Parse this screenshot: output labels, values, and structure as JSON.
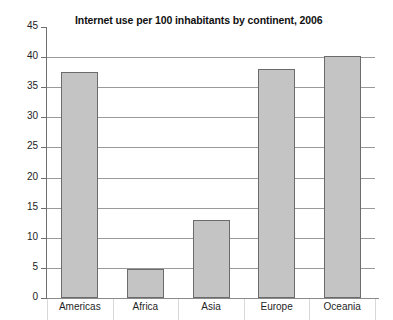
{
  "chart_data": {
    "type": "bar",
    "title": "Internet use per 100 inhabitants by continent, 2006",
    "xlabel": "",
    "ylabel": "",
    "categories": [
      "Americas",
      "Africa",
      "Asia",
      "Europe",
      "Oceania"
    ],
    "values": [
      37.5,
      4.8,
      13,
      38,
      40.2
    ],
    "ylim": [
      0,
      45
    ],
    "ytick_step": 5,
    "yticks": [
      0,
      5,
      10,
      15,
      20,
      25,
      30,
      35,
      40,
      45
    ],
    "ytick_labels": [
      "0",
      "5",
      "10",
      "15",
      "20",
      "25",
      "30",
      "35",
      "40",
      "45"
    ],
    "grid": true,
    "legend": false,
    "legend_position": "none",
    "series": [
      {
        "name": "Internet use per 100 inhabitants",
        "values": [
          37.5,
          4.8,
          13,
          38,
          40.2
        ]
      }
    ],
    "colors": {
      "bar_fill": "#c4c4c4",
      "bar_border": "#6b6b6b",
      "gridline": "#9a9a9a",
      "axis": "#6f6f6f",
      "text": "#1a1a1a",
      "background": "#ffffff"
    }
  }
}
